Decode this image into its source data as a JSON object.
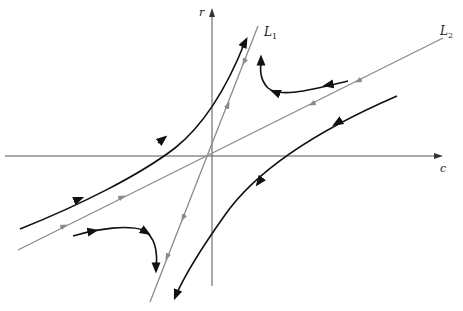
{
  "diagram": {
    "type": "phase-plane",
    "axes": {
      "horizontal_label": "c",
      "vertical_label": "r"
    },
    "lines": [
      {
        "name": "L",
        "sub": "1"
      },
      {
        "name": "L",
        "sub": "2"
      }
    ],
    "colors": {
      "axis": "#555555",
      "eigenline": "#8a8a8a",
      "trajectory": "#111111"
    }
  }
}
